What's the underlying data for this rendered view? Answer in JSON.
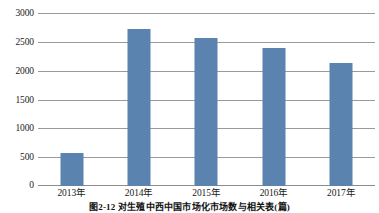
{
  "chart_data": {
    "type": "bar",
    "title": "",
    "caption": "图2-12  对生殖中西中国市场化市场数与相关表(篇)",
    "xlabel": "",
    "ylabel": "",
    "categories": [
      "2013年",
      "2014年",
      "2015年",
      "2016年",
      "2017年"
    ],
    "values": [
      580,
      2730,
      2580,
      2410,
      2140
    ],
    "series": [
      {
        "name": "数量",
        "values": [
          580,
          2730,
          2580,
          2410,
          2140
        ],
        "color": "#5b83b0"
      }
    ],
    "ylim": [
      0,
      3000
    ],
    "yticks": [
      0,
      500,
      1000,
      1500,
      2000,
      2500,
      3000
    ],
    "ytick_labels": [
      "0",
      "500",
      "1000",
      "1500",
      "2000",
      "2500",
      "3000"
    ],
    "grid": true,
    "grid_axis": "y",
    "legend": false,
    "legend_position": "none",
    "bar_color": "#5b83b0",
    "grid_color": "#9a9a9a",
    "axis_color": "#8c8c8c",
    "background": "#ffffff"
  }
}
